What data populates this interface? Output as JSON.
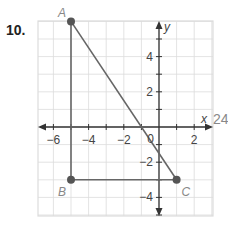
{
  "problem": {
    "number": "10."
  },
  "axes": {
    "x_label": "x",
    "y_label": "y"
  },
  "ticks": {
    "x": [
      {
        "v": -6,
        "label": "−6"
      },
      {
        "v": -4,
        "label": "−4"
      },
      {
        "v": -2,
        "label": "−2"
      },
      {
        "v": 2,
        "label": "2"
      }
    ],
    "y": [
      {
        "v": 4,
        "label": "4"
      },
      {
        "v": 2,
        "label": "2"
      },
      {
        "v": -2,
        "label": "−2"
      },
      {
        "v": -4,
        "label": "−4"
      }
    ],
    "origin_label": "0"
  },
  "points": [
    {
      "name": "A",
      "x": -5,
      "y": 6
    },
    {
      "name": "B",
      "x": -5,
      "y": -3
    },
    {
      "name": "C",
      "x": 1,
      "y": -3
    }
  ],
  "stray_text": "24",
  "colors": {
    "grid": "#dcdcdc",
    "axis": "#333333",
    "segment": "#666666",
    "point": "#555555"
  }
}
